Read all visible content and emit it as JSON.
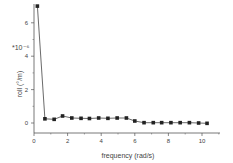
{
  "chart_data": {
    "type": "line",
    "title": "",
    "xlabel": "frequency (rad/s)",
    "ylabel": "roll (°/m)",
    "y_multiplier": "*10⁻⁶",
    "xlim": [
      0,
      11
    ],
    "ylim": [
      -0.5,
      7
    ],
    "x_ticks": [
      0,
      2,
      4,
      6,
      8,
      10
    ],
    "y_ticks": [
      0,
      2,
      4,
      6
    ],
    "grid": false,
    "legend": null,
    "series": [
      {
        "name": "roll",
        "marker": "square",
        "color": "#222222",
        "x": [
          0.2,
          0.65,
          1.2,
          1.7,
          2.25,
          2.8,
          3.3,
          3.85,
          4.4,
          4.95,
          5.5,
          6.0,
          6.55,
          7.1,
          7.6,
          8.15,
          8.7,
          9.25,
          9.8,
          10.3
        ],
        "values": [
          7.0,
          0.25,
          0.22,
          0.42,
          0.3,
          0.28,
          0.27,
          0.3,
          0.28,
          0.3,
          0.3,
          0.12,
          0.02,
          0.02,
          0.02,
          0.02,
          0.02,
          0.02,
          0.0,
          -0.02
        ]
      }
    ]
  }
}
